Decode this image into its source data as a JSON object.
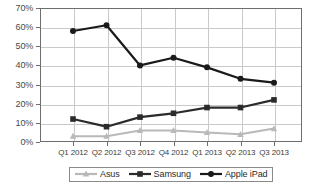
{
  "chart_data": {
    "type": "line",
    "title": "",
    "xlabel": "",
    "ylabel": "",
    "categories": [
      "Q1 2012",
      "Q2 2012",
      "Q3 2012",
      "Q4 2012",
      "Q1 2013",
      "Q2 2013",
      "Q3 2013"
    ],
    "ylim": [
      0,
      70
    ],
    "ytick_labels": [
      "0%",
      "10%",
      "20%",
      "30%",
      "40%",
      "50%",
      "60%",
      "70%"
    ],
    "ytick_values": [
      0,
      10,
      20,
      30,
      40,
      50,
      60,
      70
    ],
    "grid": true,
    "legend_position": "bottom",
    "series": [
      {
        "name": "Asus",
        "marker": "triangle",
        "color": "#b9b9b9",
        "values": [
          3,
          3,
          6,
          6,
          5,
          4,
          7
        ]
      },
      {
        "name": "Samsung",
        "marker": "square",
        "color": "#2b2b2b",
        "values": [
          12,
          8,
          13,
          15,
          18,
          18,
          22
        ]
      },
      {
        "name": "Apple iPad",
        "marker": "circle",
        "color": "#1a1a1a",
        "values": [
          58,
          61,
          40,
          44,
          39,
          33,
          31
        ]
      }
    ]
  },
  "legend": {
    "items": [
      {
        "label": "Asus"
      },
      {
        "label": "Samsung"
      },
      {
        "label": "Apple iPad"
      }
    ]
  },
  "colors": {
    "grid": "#c9c9c9",
    "axis": "#6e6e6e",
    "background": "#ffffff",
    "asus": "#b9b9b9",
    "samsung": "#2b2b2b",
    "apple": "#1a1a1a"
  }
}
